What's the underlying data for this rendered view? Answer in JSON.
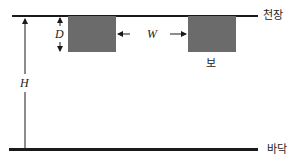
{
  "diagram": {
    "labels": {
      "ceiling": "천장",
      "floor": "바닥",
      "beam": "보"
    },
    "dimensions": {
      "depth": "D",
      "width": "W",
      "height": "H"
    },
    "colors": {
      "line": "#1a1a1a",
      "beam_fill": "#6b6b6b",
      "background": "#ffffff"
    }
  }
}
